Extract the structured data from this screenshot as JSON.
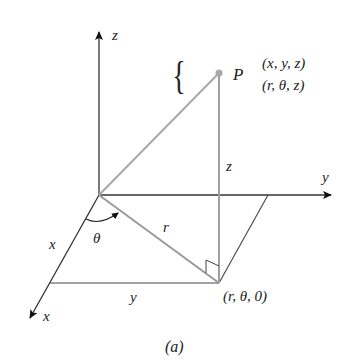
{
  "diagram": {
    "caption": "(a)",
    "axes": {
      "z_label": "z",
      "y_label": "y",
      "x_label": "x"
    },
    "point": {
      "name": "P",
      "cartesian": "(x, y, z)",
      "cylindrical": "(r, θ, z)"
    },
    "segment_labels": {
      "r": "r",
      "z": "z",
      "x": "x",
      "y": "y",
      "theta": "θ"
    },
    "projection_label": "(r, θ, 0)",
    "colors": {
      "axis": "#222222",
      "projection_lines": "#9a9a9a",
      "point": "#a8a8a8"
    }
  }
}
